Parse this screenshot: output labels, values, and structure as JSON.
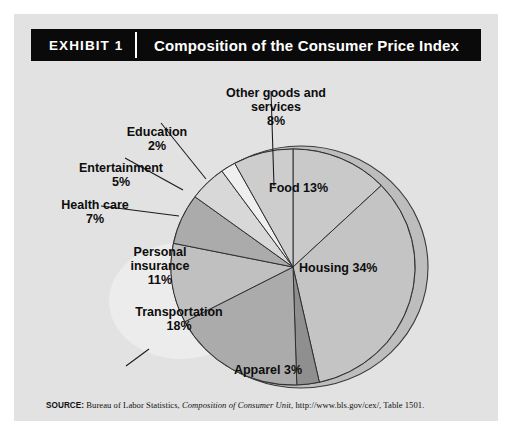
{
  "exhibit": {
    "number_label": "EXHIBIT 1",
    "title": "Composition of the Consumer Price Index"
  },
  "source": {
    "label": "SOURCE:",
    "text_before": " Bureau of Labor Statistics, ",
    "work_italic": "Composition of Consumer Unit",
    "text_after": ", http://www.bls.gov/cex/, Table 1501."
  },
  "chart_data": {
    "type": "pie",
    "title": "Composition of the Consumer Price Index",
    "units": "percent",
    "start_angle_deg": 0,
    "direction": "clockwise",
    "legend": "none-inline-labels",
    "categories": [
      "Food",
      "Housing",
      "Apparel",
      "Transportation",
      "Personal insurance",
      "Health care",
      "Entertainment",
      "Education",
      "Other goods and services"
    ],
    "values": [
      13,
      34,
      3,
      18,
      11,
      7,
      5,
      2,
      8
    ],
    "colors": [
      "#c9c9c9",
      "#c4c4c4",
      "#8f8f8f",
      "#ababab",
      "#c0c0c0",
      "#ababab",
      "#d8d8d8",
      "#efefef",
      "#cdcdcd"
    ],
    "slice_labels": [
      {
        "name": "Food",
        "text": "Food  13%",
        "percent": "13%",
        "placement": "inside"
      },
      {
        "name": "Housing",
        "text": "Housing  34%",
        "percent": "34%",
        "placement": "inside"
      },
      {
        "name": "Apparel",
        "text": "Apparel  3%",
        "percent": "3%",
        "placement": "outside"
      },
      {
        "name": "Transportation",
        "text": "Transportation",
        "percent": "18%",
        "placement": "inside"
      },
      {
        "name": "Personal insurance",
        "text": "Personal",
        "text2": "insurance",
        "percent": "11%",
        "placement": "inside"
      },
      {
        "name": "Health care",
        "text": "Health care",
        "percent": "7%",
        "placement": "outside"
      },
      {
        "name": "Entertainment",
        "text": "Entertainment",
        "percent": "5%",
        "placement": "outside"
      },
      {
        "name": "Education",
        "text": "Education",
        "percent": "2%",
        "placement": "outside"
      },
      {
        "name": "Other goods and services",
        "text": "Other goods and",
        "text2": "services",
        "percent": "8%",
        "placement": "outside"
      }
    ]
  },
  "labels": {
    "food": "Food  13%",
    "housing": "Housing  34%",
    "apparel": "Apparel  3%",
    "transportation": "Transportation",
    "transportation_pct": "18%",
    "personal_1": "Personal",
    "personal_2": "insurance",
    "personal_pct": "11%",
    "health": "Health care",
    "health_pct": "7%",
    "entertainment": "Entertainment",
    "entertainment_pct": "5%",
    "education": "Education",
    "education_pct": "2%",
    "other_1": "Other goods and",
    "other_2": "services",
    "other_pct": "8%"
  }
}
